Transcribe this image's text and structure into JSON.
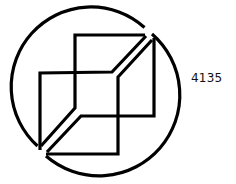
{
  "figure": {
    "label": "4135",
    "stroke_color": "#000000",
    "background": "#ffffff"
  },
  "geometry": {
    "circle": {
      "cx": 98,
      "cy": 92,
      "r": 79
    },
    "upper_shape": {
      "outer": "M40,150 L40,73 L112,72 L147,35",
      "inner": "M146,35 L74,35 L75,108 L42,146"
    },
    "lower_shape": {
      "outer": "M154,39 L154,116 L81,116 L46,152",
      "inner": "M45,154 L118,154 L118,77 L151,40"
    }
  }
}
